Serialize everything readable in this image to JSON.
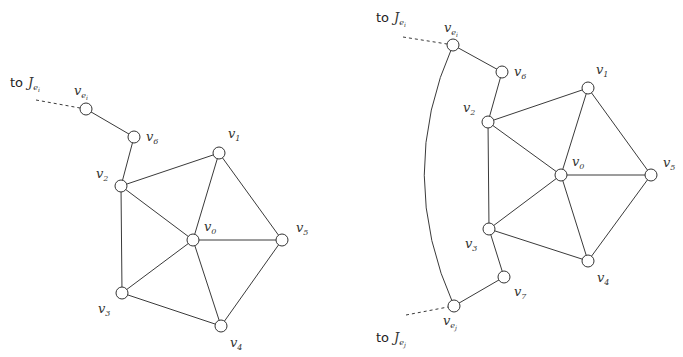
{
  "diagrams": [
    {
      "id": "left",
      "annotation": {
        "prefix": "to",
        "var": "J",
        "sub": "e",
        "subsub": "i"
      },
      "nodes": {
        "vei": {
          "label": "v",
          "sub": "e",
          "subsub": "i"
        },
        "v6": {
          "label": "v",
          "sub": "6"
        },
        "v2": {
          "label": "v",
          "sub": "2"
        },
        "v1": {
          "label": "v",
          "sub": "1"
        },
        "v0": {
          "label": "v",
          "sub": "0"
        },
        "v5": {
          "label": "v",
          "sub": "5"
        },
        "v3": {
          "label": "v",
          "sub": "3"
        },
        "v4": {
          "label": "v",
          "sub": "4"
        }
      },
      "edges": [
        [
          "vei",
          "v6"
        ],
        [
          "v6",
          "v2"
        ],
        [
          "v2",
          "v1"
        ],
        [
          "v2",
          "v0"
        ],
        [
          "v2",
          "v3"
        ],
        [
          "v1",
          "v0"
        ],
        [
          "v1",
          "v5"
        ],
        [
          "v0",
          "v5"
        ],
        [
          "v0",
          "v3"
        ],
        [
          "v0",
          "v4"
        ],
        [
          "v3",
          "v4"
        ],
        [
          "v4",
          "v5"
        ]
      ],
      "dashed_edges": [
        [
          "to_J_ei",
          "vei"
        ]
      ]
    },
    {
      "id": "right",
      "annotations": [
        {
          "prefix": "to",
          "var": "J",
          "sub": "e",
          "subsub": "i"
        },
        {
          "prefix": "to",
          "var": "J",
          "sub": "e",
          "subsub": "j"
        }
      ],
      "nodes": {
        "vei": {
          "label": "v",
          "sub": "e",
          "subsub": "i"
        },
        "v6": {
          "label": "v",
          "sub": "6"
        },
        "v2": {
          "label": "v",
          "sub": "2"
        },
        "v1": {
          "label": "v",
          "sub": "1"
        },
        "v0": {
          "label": "v",
          "sub": "0"
        },
        "v5": {
          "label": "v",
          "sub": "5"
        },
        "v3": {
          "label": "v",
          "sub": "3"
        },
        "v4": {
          "label": "v",
          "sub": "4"
        },
        "v7": {
          "label": "v",
          "sub": "7"
        },
        "vej": {
          "label": "v",
          "sub": "e",
          "subsub": "j"
        }
      },
      "edges": [
        [
          "vei",
          "v6"
        ],
        [
          "v6",
          "v2"
        ],
        [
          "v2",
          "v1"
        ],
        [
          "v2",
          "v0"
        ],
        [
          "v2",
          "v3"
        ],
        [
          "v1",
          "v0"
        ],
        [
          "v1",
          "v5"
        ],
        [
          "v0",
          "v5"
        ],
        [
          "v0",
          "v3"
        ],
        [
          "v0",
          "v4"
        ],
        [
          "v3",
          "v4"
        ],
        [
          "v4",
          "v5"
        ],
        [
          "v3",
          "v7"
        ],
        [
          "v7",
          "vej"
        ],
        [
          "vei",
          "vej"
        ]
      ],
      "dashed_edges": [
        [
          "to_J_ei",
          "vei"
        ],
        [
          "to_J_ej",
          "vej"
        ]
      ]
    }
  ],
  "text": {
    "to": "to",
    "J": "J",
    "v": "v",
    "e": "e",
    "i": "i",
    "j": "j",
    "s0": "0",
    "s1": "1",
    "s2": "2",
    "s3": "3",
    "s4": "4",
    "s5": "5",
    "s6": "6",
    "s7": "7"
  }
}
